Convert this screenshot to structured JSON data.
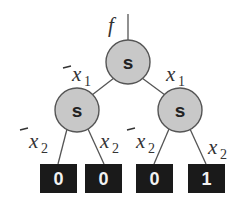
{
  "diagram": {
    "type": "binary decision tree",
    "function_label": "f",
    "nodes": [
      {
        "id": "root",
        "label": "s",
        "cx": 128,
        "cy": 62,
        "r": 22
      },
      {
        "id": "left",
        "label": "s",
        "cx": 77,
        "cy": 110,
        "r": 22
      },
      {
        "id": "right",
        "label": "s",
        "cx": 180,
        "cy": 110,
        "r": 22
      }
    ],
    "leaves": [
      {
        "id": "leaf-0",
        "value": "0",
        "x": 40,
        "y": 164
      },
      {
        "id": "leaf-1",
        "value": "0",
        "x": 84,
        "y": 164
      },
      {
        "id": "leaf-2",
        "value": "0",
        "x": 136,
        "y": 164
      },
      {
        "id": "leaf-3",
        "value": "1",
        "x": 188,
        "y": 164
      }
    ],
    "edge_labels": {
      "root_left": {
        "var": "x",
        "sub": "1",
        "negated": true
      },
      "root_right": {
        "var": "x",
        "sub": "1",
        "negated": false
      },
      "left_left": {
        "var": "x",
        "sub": "2",
        "negated": true
      },
      "left_right": {
        "var": "x",
        "sub": "2",
        "negated": false
      },
      "right_left": {
        "var": "x",
        "sub": "2",
        "negated": true
      },
      "right_right": {
        "var": "x",
        "sub": "2",
        "negated": false
      }
    },
    "colors": {
      "node_fill": "#c8c8c8",
      "leaf_fill": "#1a1a1a",
      "leaf_text": "#f2f2f2",
      "edge": "#555555"
    }
  }
}
